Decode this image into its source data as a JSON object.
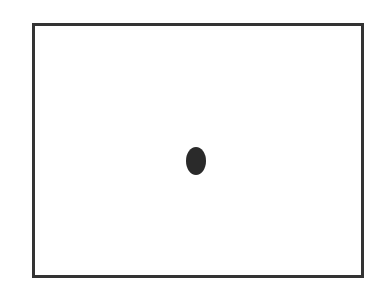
{
  "diagram": {
    "shapes": [
      {
        "type": "rectangle",
        "role": "frame",
        "stroke": "#333333",
        "fill": "#ffffff"
      },
      {
        "type": "ellipse",
        "role": "center-dot",
        "fill": "#2a2a2a"
      }
    ],
    "colors": {
      "background": "#ffffff",
      "frame_stroke": "#333333",
      "dot_fill": "#2a2a2a"
    }
  }
}
